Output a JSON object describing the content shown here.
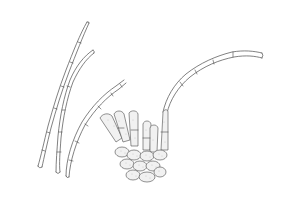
{
  "figure": {
    "colors": {
      "background": "#ffffff",
      "ink": "#4a4a4a",
      "cell_fill": "#f1f1f1",
      "stipple": "#bdbdbd"
    },
    "elements": [
      {
        "name": "filament-left-pair",
        "description": "two long slender septate filaments crossing, tips at upper left"
      },
      {
        "name": "filament-middle",
        "description": "curved septate filament rising from lower left toward the cluster"
      },
      {
        "name": "filament-right-arc",
        "description": "long arching septate filament extending to upper right from cluster"
      },
      {
        "name": "basal-cell-cluster",
        "description": "stippled cluster of rounded basal cells with short upright branches"
      }
    ]
  }
}
